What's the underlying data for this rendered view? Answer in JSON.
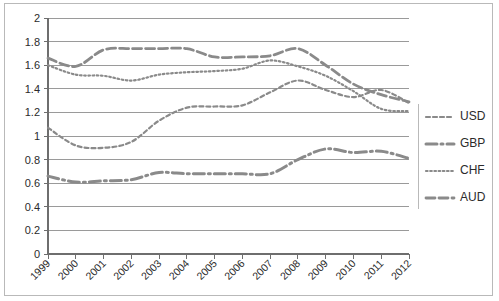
{
  "chart_data": {
    "type": "line",
    "title": "",
    "subtitle": "",
    "xlabel": "",
    "ylabel": "",
    "x": [
      "1999",
      "2000",
      "2001",
      "2002",
      "2003",
      "2004",
      "2005",
      "2006",
      "2007",
      "2008",
      "2009",
      "2010",
      "2011",
      "2012"
    ],
    "categories": [
      "1999",
      "2000",
      "2001",
      "2002",
      "2003",
      "2004",
      "2005",
      "2006",
      "2007",
      "2008",
      "2009",
      "2010",
      "2011",
      "2012"
    ],
    "ylim": [
      0,
      2
    ],
    "xlim_labels": [
      "1999",
      "2012"
    ],
    "y_ticks": [
      "0",
      "0.2",
      "0.4",
      "0.6",
      "0.8",
      "1",
      "1.2",
      "1.4",
      "1.6",
      "1.8",
      "2"
    ],
    "y_tick_values": [
      0,
      0.2,
      0.4,
      0.6,
      0.8,
      1.0,
      1.2,
      1.4,
      1.6,
      1.8,
      2.0
    ],
    "grid": true,
    "grid_axis": "y",
    "legend_position": "right",
    "series": [
      {
        "name": "USD",
        "dash_style": "dashed",
        "color": "#8a8a8a",
        "values": [
          1.07,
          0.92,
          0.9,
          0.95,
          1.13,
          1.24,
          1.25,
          1.26,
          1.37,
          1.47,
          1.39,
          1.33,
          1.39,
          1.28
        ]
      },
      {
        "name": "GBP",
        "dash_style": "dash-dot",
        "color": "#8a8a8a",
        "values": [
          0.66,
          0.61,
          0.62,
          0.63,
          0.69,
          0.68,
          0.68,
          0.68,
          0.68,
          0.8,
          0.89,
          0.86,
          0.87,
          0.81
        ]
      },
      {
        "name": "CHF",
        "dash_style": "dotted",
        "color": "#8a8a8a",
        "values": [
          1.6,
          1.52,
          1.51,
          1.47,
          1.52,
          1.54,
          1.55,
          1.57,
          1.64,
          1.59,
          1.51,
          1.38,
          1.23,
          1.21
        ]
      },
      {
        "name": "AUD",
        "dash_style": "long-dash",
        "color": "#8a8a8a",
        "values": [
          1.66,
          1.59,
          1.73,
          1.74,
          1.74,
          1.74,
          1.67,
          1.67,
          1.68,
          1.74,
          1.6,
          1.44,
          1.35,
          1.29
        ]
      }
    ],
    "legend_entries": [
      {
        "label": "USD",
        "dash_style": "dashed"
      },
      {
        "label": "GBP",
        "dash_style": "dash-dot"
      },
      {
        "label": "CHF",
        "dash_style": "dotted"
      },
      {
        "label": "AUD",
        "dash_style": "long-dash"
      }
    ]
  }
}
